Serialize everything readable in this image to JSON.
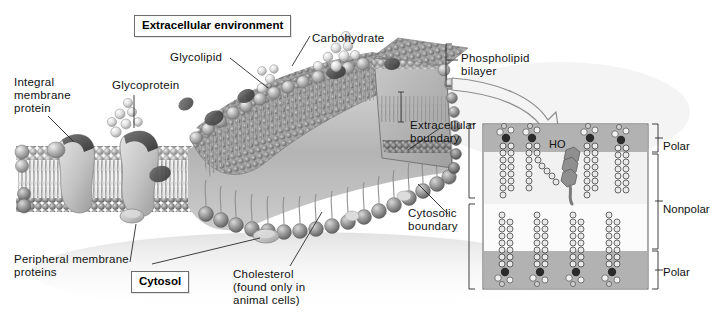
{
  "figure": {
    "background": "#ffffff",
    "palette": {
      "membrane_head": "#9a9a9a",
      "membrane_head_light": "#cfcfcf",
      "membrane_tail": "#b5b5b5",
      "protein_light": "#c9c9c9",
      "protein_dark": "#4a4a4a",
      "carbohydrate": "#e8e8e8",
      "inset_panel": "#b9b9b9",
      "inset_polar_band": "#9d9d9d",
      "inset_nonpolar_band": "#ffffff",
      "outline": "#6d6d6d",
      "label_text": "#111111",
      "arrow_fill": "#f2f2f2",
      "arrow_stroke": "#8a8a8a"
    }
  },
  "boxed_labels": {
    "extracellular_environment": "Extracellular environment",
    "cytosol": "Cytosol"
  },
  "labels": {
    "integral_membrane_protein": "Integral\nmembrane\nprotein",
    "glycoprotein": "Glycoprotein",
    "glycolipid": "Glycolipid",
    "carbohydrate": "Carbohydrate",
    "phospholipid_bilayer": "Phospholipid\nbilayer",
    "extracellular_boundary": "Extracellular\nboundary",
    "cytosolic_boundary": "Cytosolic\nboundary",
    "peripheral_membrane_proteins": "Peripheral membrane\nproteins",
    "cholesterol": "Cholesterol\n(found only in\nanimal cells)"
  },
  "inset": {
    "name": "molecular-detail-panel",
    "hydroxyl_label": "HO",
    "region_labels": {
      "polar_top": "Polar",
      "nonpolar": "Nonpolar",
      "polar_bottom": "Polar"
    },
    "leaflets": {
      "outer_lipid_count": 4,
      "inner_lipid_count": 4,
      "cholesterol_count": 1
    },
    "bounds": {
      "x": 483,
      "y": 124,
      "width": 165,
      "height": 165
    }
  },
  "diagram": {
    "bilayer_leaflets": 2,
    "integral_proteins": 2,
    "peripheral_proteins": 2,
    "glycoprotein_chains": 1,
    "glycolipid_chains": 1,
    "carbohydrate_chains": 2,
    "cholesterol_molecules_visible": 2
  }
}
